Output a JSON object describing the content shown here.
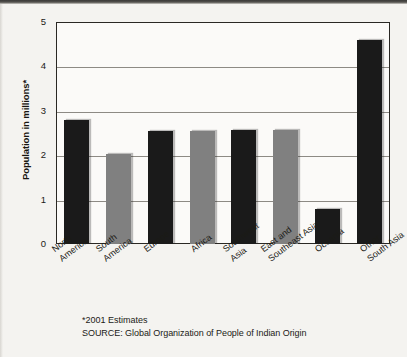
{
  "chart_data": {
    "type": "bar",
    "title": "",
    "xlabel": "",
    "ylabel": "Population in millions*",
    "ylim": [
      0,
      5
    ],
    "ytick_labels": [
      "5",
      "4",
      "3",
      "2",
      "1",
      "0"
    ],
    "ytick_values": [
      5,
      4,
      3,
      2,
      1,
      0
    ],
    "grid": true,
    "legend": "none",
    "categories": [
      "North America",
      "South America",
      "Europe",
      "Africa",
      "Southwest Asia",
      "East and Southeast Asia",
      "Oceania",
      "Other South Asia"
    ],
    "category_lines": [
      [
        "North",
        "America"
      ],
      [
        "South",
        "America"
      ],
      [
        "Europe",
        ""
      ],
      [
        "Africa",
        ""
      ],
      [
        "Southwest",
        "Asia"
      ],
      [
        "East and",
        "Southeast Asia"
      ],
      [
        "Oceania",
        ""
      ],
      [
        "Other",
        "South Asia"
      ]
    ],
    "values": [
      2.8,
      2.03,
      2.55,
      2.55,
      2.56,
      2.56,
      0.78,
      4.6
    ],
    "bar_colors": [
      "#1a1a1a",
      "#808080",
      "#1a1a1a",
      "#808080",
      "#1a1a1a",
      "#808080",
      "#1a1a1a",
      "#1a1a1a"
    ],
    "annotations": [
      "*2001 Estimates",
      "SOURCE: Global Organization of People of Indian Origin"
    ]
  },
  "footnotes": {
    "estimate_note": "*2001 Estimates",
    "source_note": "SOURCE: Global Organization of People of Indian Origin"
  },
  "colors": {
    "bar_dark": "#1a1a1a",
    "bar_gray": "#808080",
    "axis": "#2a2824",
    "gridline": "#8d8a84",
    "paper": "#f4f3f0",
    "plot_background": "#fbfaf8",
    "text": "#1b1a16"
  }
}
